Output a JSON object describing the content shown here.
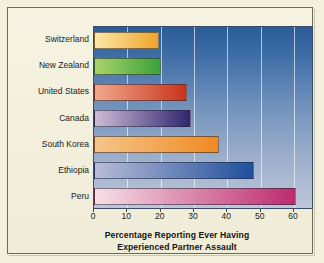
{
  "chart_data": {
    "type": "bar",
    "orientation": "horizontal",
    "title": "",
    "xlabel": "Percentage Reporting Ever Having Experienced Partner Assault",
    "ylabel": "",
    "categories": [
      "Switzerland",
      "New Zealand",
      "United States",
      "Canada",
      "South Korea",
      "Ethiopia",
      "Peru"
    ],
    "values": [
      19.5,
      20,
      28,
      29,
      37.5,
      48,
      60.5
    ],
    "xlim": [
      0,
      66
    ],
    "xticks": [
      0,
      10,
      20,
      30,
      40,
      50,
      60
    ],
    "xtick_labels": [
      "0",
      "10",
      "20",
      "30",
      "40",
      "50",
      "60"
    ],
    "grid": "vertical",
    "legend": "none",
    "bar_colors": [
      {
        "category": "Switzerland",
        "start": "#fbe9a8",
        "end": "#f0a32a"
      },
      {
        "category": "New Zealand",
        "start": "#a9d469",
        "end": "#3ca13c"
      },
      {
        "category": "United States",
        "start": "#f0a98c",
        "end": "#c9331c"
      },
      {
        "category": "Canada",
        "start": "#cdbcd6",
        "end": "#30246f"
      },
      {
        "category": "South Korea",
        "start": "#f6c58a",
        "end": "#ef8a22"
      },
      {
        "category": "Ethiopia",
        "start": "#b9bcd8",
        "end": "#1f4f9c"
      },
      {
        "category": "Peru",
        "start": "#f6dfe6",
        "end": "#bd2a6e"
      }
    ]
  },
  "axis_title_lines": [
    "Percentage Reporting Ever Having",
    "Experienced Partner Assault"
  ],
  "colors": {
    "page_background": "#f3f0de",
    "frame_border": "#6c6a58",
    "plot_top": "#2a5b96",
    "plot_bottom": "#bcc6d8",
    "gridline": "#ffffff",
    "text": "#1b1b1b"
  }
}
